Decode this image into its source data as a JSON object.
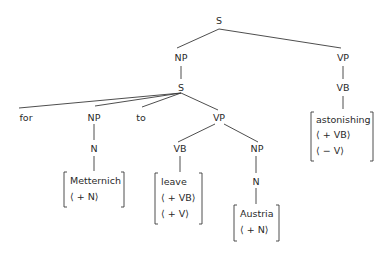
{
  "diagram": {
    "type": "syntax-tree",
    "nodes": {
      "root_s": "S",
      "np_top": "NP",
      "vp_top": "VP",
      "s_embedded": "S",
      "vb_right": "VB",
      "for": "for",
      "np_left": "NP",
      "to": "to",
      "vp_mid": "VP",
      "n_left": "N",
      "vb_mid": "VB",
      "np_mid": "NP",
      "n_mid": "N"
    },
    "feature_boxes": {
      "metternich": {
        "word": "Metternich",
        "features": [
          "⟨ + N⟩"
        ]
      },
      "leave": {
        "word": "leave",
        "features": [
          "⟨ + VB⟩",
          "⟨ + V⟩"
        ]
      },
      "austria": {
        "word": "Austria",
        "features": [
          "⟨ + N⟩"
        ]
      },
      "astonishing": {
        "word": "astonishing",
        "features": [
          "⟨ + VB⟩",
          "⟨ − V⟩"
        ]
      }
    },
    "edges": [
      [
        "S",
        "NP"
      ],
      [
        "S",
        "VP"
      ],
      [
        "NP",
        "S"
      ],
      [
        "VP",
        "VB"
      ],
      [
        "VB",
        "astonishing"
      ],
      [
        "S",
        "for"
      ],
      [
        "S",
        "NP"
      ],
      [
        "S",
        "to"
      ],
      [
        "S",
        "VP"
      ],
      [
        "NP",
        "N"
      ],
      [
        "N",
        "Metternich"
      ],
      [
        "VP",
        "VB"
      ],
      [
        "VP",
        "NP"
      ],
      [
        "VB",
        "leave"
      ],
      [
        "NP",
        "N"
      ],
      [
        "N",
        "Austria"
      ]
    ]
  }
}
